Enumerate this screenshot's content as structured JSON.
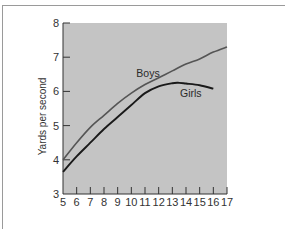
{
  "chart_data": {
    "type": "line",
    "title": "",
    "xlabel": "",
    "ylabel": "Yards per second",
    "xlim": [
      5,
      17
    ],
    "ylim": [
      3,
      8
    ],
    "x_ticks": [
      5,
      6,
      7,
      8,
      9,
      10,
      11,
      12,
      13,
      14,
      15,
      16,
      17
    ],
    "y_ticks": [
      3,
      4,
      5,
      6,
      7,
      8
    ],
    "grid": false,
    "legend": "inline labels",
    "background": "#c4c4c4",
    "series": [
      {
        "name": "Boys",
        "color": "#555555",
        "x": [
          5,
          6,
          7,
          8,
          9,
          10,
          11,
          12,
          13,
          14,
          15,
          16,
          17
        ],
        "values": [
          4.0,
          4.5,
          4.95,
          5.3,
          5.65,
          5.95,
          6.2,
          6.4,
          6.6,
          6.8,
          6.95,
          7.15,
          7.3
        ]
      },
      {
        "name": "Girls",
        "color": "#1a1a1a",
        "x": [
          5,
          6,
          7,
          8,
          9,
          10,
          11,
          12,
          13,
          13.5,
          14,
          15,
          16
        ],
        "values": [
          3.65,
          4.1,
          4.5,
          4.9,
          5.25,
          5.6,
          5.95,
          6.15,
          6.24,
          6.25,
          6.23,
          6.18,
          6.08
        ]
      }
    ],
    "annotations": [
      {
        "text": "Boys",
        "x": 11.1,
        "y": 6.55
      },
      {
        "text": "Girls",
        "x": 14.0,
        "y": 5.95
      }
    ]
  },
  "axis": {
    "y_title": "Yards per second",
    "y_labels": [
      "3",
      "4",
      "5",
      "6",
      "7",
      "8"
    ],
    "x_labels": [
      "5",
      "6",
      "7",
      "8",
      "9",
      "10",
      "11",
      "12",
      "13",
      "14",
      "15",
      "16",
      "17"
    ]
  },
  "labels": {
    "boys": "Boys",
    "girls": "Girls"
  }
}
